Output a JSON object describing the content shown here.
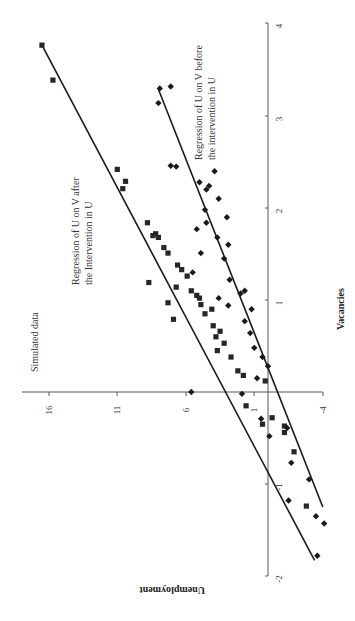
{
  "chart_data": {
    "type": "scatter",
    "orientation_note": "figure rotated 90 degrees: vacancies axis vertical (right), unemployment axis horizontal",
    "xlabel": "Vacancies",
    "ylabel": "Unemployment",
    "xlim": [
      -2,
      4
    ],
    "ylim": [
      -4,
      16
    ],
    "x_ticks": [
      "-2",
      "-1",
      "1",
      "2",
      "3",
      "4"
    ],
    "y_ticks": [
      "-4",
      "1",
      "6",
      "11",
      "16"
    ],
    "grid": false,
    "annotations": [
      "Simulated data",
      "Regression of U on V after the Intervention in U",
      "Regression of U on V before the intervention in U"
    ],
    "series": [
      {
        "name": "After intervention (squares)",
        "marker": "square",
        "points": [
          [
            3.77,
            16.5
          ],
          [
            3.39,
            15.7
          ],
          [
            2.42,
            11.0
          ],
          [
            2.29,
            10.4
          ],
          [
            2.21,
            10.6
          ],
          [
            1.84,
            8.8
          ],
          [
            1.72,
            8.2
          ],
          [
            1.7,
            8.4
          ],
          [
            1.68,
            8.0
          ],
          [
            1.57,
            7.6
          ],
          [
            1.51,
            7.3
          ],
          [
            1.38,
            6.6
          ],
          [
            1.33,
            6.3
          ],
          [
            1.26,
            5.9
          ],
          [
            1.19,
            8.7
          ],
          [
            1.14,
            6.7
          ],
          [
            1.1,
            5.6
          ],
          [
            1.05,
            5.2
          ],
          [
            1.02,
            5.0
          ],
          [
            0.97,
            7.3
          ],
          [
            0.95,
            4.9
          ],
          [
            0.9,
            4.1
          ],
          [
            0.85,
            4.6
          ],
          [
            0.79,
            6.9
          ],
          [
            0.72,
            4.0
          ],
          [
            0.66,
            3.5
          ],
          [
            0.6,
            3.8
          ],
          [
            0.53,
            3.2
          ],
          [
            0.45,
            3.7
          ],
          [
            0.38,
            2.7
          ],
          [
            0.23,
            2.2
          ],
          [
            0.18,
            1.8
          ],
          [
            0.12,
            0.2
          ],
          [
            -0.15,
            1.6
          ],
          [
            -0.28,
            -0.3
          ],
          [
            -0.35,
            0.4
          ],
          [
            -0.37,
            -1.2
          ],
          [
            -0.44,
            -1.2
          ],
          [
            -0.65,
            -1.9
          ],
          [
            -1.24,
            -2.8
          ]
        ]
      },
      {
        "name": "Before intervention (diamonds)",
        "marker": "diamond",
        "points": [
          [
            3.3,
            7.9
          ],
          [
            3.32,
            7.1
          ],
          [
            3.14,
            8.0
          ],
          [
            2.46,
            7.1
          ],
          [
            2.45,
            6.7
          ],
          [
            2.4,
            3.9
          ],
          [
            2.28,
            5.0
          ],
          [
            2.24,
            4.3
          ],
          [
            2.2,
            4.5
          ],
          [
            2.1,
            3.6
          ],
          [
            1.98,
            4.6
          ],
          [
            1.9,
            3.0
          ],
          [
            1.84,
            4.5
          ],
          [
            1.77,
            5.2
          ],
          [
            1.68,
            3.7
          ],
          [
            1.6,
            2.9
          ],
          [
            1.51,
            4.9
          ],
          [
            1.45,
            3.2
          ],
          [
            1.3,
            5.5
          ],
          [
            1.22,
            2.8
          ],
          [
            1.1,
            1.7
          ],
          [
            1.07,
            2.0
          ],
          [
            1.02,
            3.6
          ],
          [
            0.94,
            2.9
          ],
          [
            0.9,
            1.2
          ],
          [
            0.77,
            1.7
          ],
          [
            0.64,
            1.3
          ],
          [
            0.48,
            1.0
          ],
          [
            0.38,
            0.4
          ],
          [
            0.28,
            0.0
          ],
          [
            0.15,
            0.8
          ],
          [
            0.0,
            5.6
          ],
          [
            -0.02,
            1.9
          ],
          [
            -0.29,
            0.5
          ],
          [
            -0.39,
            -1.4
          ],
          [
            -0.48,
            -0.1
          ],
          [
            -0.77,
            -1.7
          ],
          [
            -0.95,
            -3.0
          ],
          [
            -1.18,
            -1.5
          ],
          [
            -1.35,
            -3.5
          ],
          [
            -1.43,
            -4.1
          ],
          [
            -1.78,
            -3.6
          ]
        ]
      }
    ],
    "regression_lines": [
      {
        "name": "Regression of U on V after the Intervention in U",
        "from": [
          3.77,
          16.5
        ],
        "to": [
          -1.83,
          -3.4
        ]
      },
      {
        "name": "Regression of U on V before the intervention in U",
        "from": [
          3.29,
          8.0
        ],
        "to": [
          -1.25,
          -4.0
        ]
      }
    ]
  },
  "labels": {
    "simulated": "Simulated data",
    "after_line1": "Regression of U on V after",
    "after_line2": "the Intervention in U",
    "before_line1": "Regression of U on V before",
    "before_line2": "the intervention in U",
    "x_axis_title": "Vacancies",
    "y_axis_title": "Unemployment"
  },
  "ticks": {
    "v": [
      {
        "label": "4",
        "y": 23
      },
      {
        "label": "3",
        "y": 116
      },
      {
        "label": "2",
        "y": 208
      },
      {
        "label": "1",
        "y": 300
      },
      {
        "label": "-1",
        "y": 484
      },
      {
        "label": "-2",
        "y": 576
      }
    ],
    "u": [
      {
        "label": "16",
        "x": 49
      },
      {
        "label": "11",
        "x": 117
      },
      {
        "label": "6",
        "x": 186
      },
      {
        "label": "1",
        "x": 254
      },
      {
        "label": "-4",
        "x": 323
      }
    ]
  }
}
